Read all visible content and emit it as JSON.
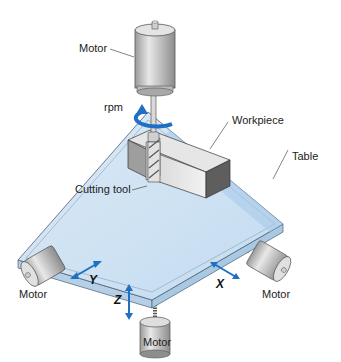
{
  "diagram": {
    "type": "CNC milling machine schematic",
    "labels": {
      "top_motor": "Motor",
      "rpm": "rpm",
      "workpiece": "Workpiece",
      "table": "Table",
      "cutting_tool": "Cutting tool",
      "left_motor": "Motor",
      "right_motor": "Motor",
      "bottom_motor": "Motor"
    },
    "axes": {
      "x": "X",
      "y": "Y",
      "z": "Z"
    },
    "colors": {
      "table_top": "#cfe3f3",
      "table_edge": "#b7d3ea",
      "arrow_blue": "#1f6fc4",
      "motor_gray": "#c8c8c8",
      "workpiece_gray": "#a9a9a9"
    }
  }
}
